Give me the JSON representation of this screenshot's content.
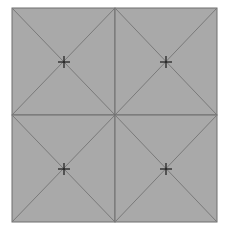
{
  "diagram": {
    "type": "tiled-grid",
    "rows": 2,
    "cols": 2,
    "bounds": {
      "x0": 12,
      "y0": 8,
      "x1": 217,
      "y1": 222
    },
    "divider": {
      "x": 115,
      "y": 115
    },
    "tile_fill": "#a9a9a9",
    "line_color": "#7a7a7a",
    "border_color": "#6e6e6e",
    "marker_color": "#1a1a1a",
    "marker_shape": "crosshair",
    "markers": [
      {
        "name": "top-left",
        "x": 64,
        "y": 62
      },
      {
        "name": "top-right",
        "x": 166,
        "y": 62
      },
      {
        "name": "bottom-left",
        "x": 64,
        "y": 169
      },
      {
        "name": "bottom-right",
        "x": 166,
        "y": 169
      }
    ]
  }
}
